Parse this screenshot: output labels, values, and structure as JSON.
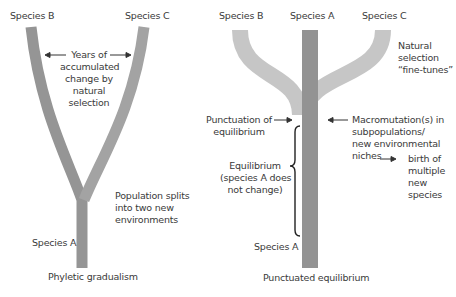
{
  "left_panel": {
    "title": "Phyletic gradualism",
    "species_b": "Species B",
    "species_c": "Species C",
    "species_a": "Species A",
    "annotation_top": [
      "Years of",
      "accumulated",
      "change by",
      "natural",
      "selection"
    ],
    "annotation_split": [
      "Population splits",
      "into two new",
      "environments"
    ]
  },
  "right_panel": {
    "title": "Punctuated equilibrium",
    "species_b": "Species B",
    "species_a_top": "Species A",
    "species_c": "Species C",
    "species_a_bottom": "Species A",
    "natural_selection": [
      "Natural",
      "selection",
      "“fine-tunes”"
    ],
    "punctuation": [
      "Punctuation of",
      "equilibrium"
    ],
    "macromutation": [
      "Macromutation(s) in",
      "subpopulations/",
      "new environmental",
      "niches"
    ],
    "birth": [
      "birth of",
      "multiple",
      "new",
      "species"
    ],
    "equilibrium": [
      "Equilibrium",
      "(species A does",
      "not change)"
    ]
  },
  "colors": {
    "branch_dark": "#8f8f8f",
    "branch_light": "#c4c4c4",
    "text": "#3a3a3a"
  }
}
